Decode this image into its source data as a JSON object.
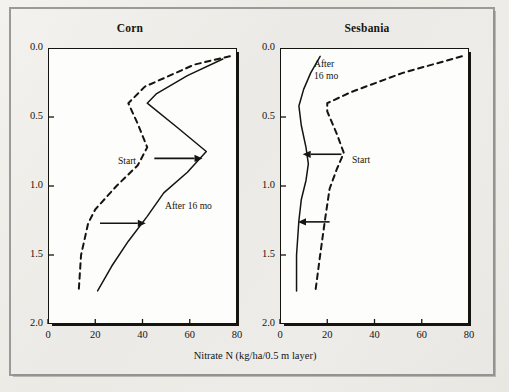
{
  "figure": {
    "background_color": "#efeeea",
    "frame_color": "#9a9a98",
    "ink_color": "#15140f",
    "plot_background": "#fdfdfb"
  },
  "axis": {
    "x_label": "Nitrate N (kg/ha/0.5 m layer)",
    "x_ticks": [
      "0",
      "20",
      "40",
      "60",
      "80"
    ],
    "y_ticks": [
      "0.0",
      "0.5",
      "1.0",
      "1.5",
      "2.0"
    ]
  },
  "panels": [
    {
      "title": "Corn",
      "annotations": [
        {
          "name": "start-label",
          "text": "Start"
        },
        {
          "name": "after-label",
          "text": "After 16 mo"
        }
      ],
      "arrow_direction": "right"
    },
    {
      "title": "Sesbania",
      "annotations": [
        {
          "name": "after-label",
          "text": "After"
        },
        {
          "name": "after-label-2",
          "text": "16 mo"
        },
        {
          "name": "start-label",
          "text": "Start"
        }
      ],
      "arrow_direction": "left"
    }
  ],
  "chart_data": {
    "type": "line",
    "xlabel": "Nitrate N (kg/ha/0.5 m layer)",
    "ylabel": "Soil depth (m)",
    "xlim": [
      0,
      80
    ],
    "ylim": [
      2.0,
      0.0
    ],
    "y_inverted": true,
    "xticks": [
      0,
      20,
      40,
      60,
      80
    ],
    "yticks": [
      0.0,
      0.5,
      1.0,
      1.5,
      2.0
    ],
    "grid": false,
    "legend": "in-plot annotations",
    "panels": [
      {
        "name": "Corn",
        "series": [
          {
            "name": "Start",
            "style": "dashed",
            "x": [
              77,
              62,
              41,
              34,
              38,
              42,
              38,
              29,
              20,
              17,
              14,
              13
            ],
            "y": [
              0.06,
              0.12,
              0.28,
              0.4,
              0.55,
              0.72,
              0.85,
              1.0,
              1.17,
              1.27,
              1.5,
              1.76
            ]
          },
          {
            "name": "After 16 mo",
            "style": "solid",
            "x": [
              74,
              59,
              46,
              42,
              55,
              67,
              59,
              49,
              42,
              34,
              27,
              21
            ],
            "y": [
              0.08,
              0.2,
              0.33,
              0.4,
              0.58,
              0.75,
              0.9,
              1.05,
              1.22,
              1.4,
              1.58,
              1.76
            ]
          }
        ],
        "arrows": [
          {
            "from_x": 45,
            "to_x": 62,
            "y": 0.8,
            "direction": "right"
          },
          {
            "from_x": 22,
            "to_x": 38,
            "y": 1.27,
            "direction": "right"
          }
        ]
      },
      {
        "name": "Sesbania",
        "series": [
          {
            "name": "Start",
            "style": "dashed",
            "x": [
              77,
              52,
              30,
              20,
              20,
              24,
              27,
              24,
              21,
              19,
              17,
              15
            ],
            "y": [
              0.06,
              0.18,
              0.32,
              0.4,
              0.46,
              0.62,
              0.76,
              0.88,
              1.02,
              1.25,
              1.5,
              1.76
            ]
          },
          {
            "name": "After 16 mo",
            "style": "solid",
            "x": [
              17,
              13,
              10,
              8,
              9,
              11,
              12,
              11,
              9,
              8,
              7,
              7
            ],
            "y": [
              0.06,
              0.18,
              0.3,
              0.42,
              0.56,
              0.72,
              0.84,
              0.96,
              1.1,
              1.25,
              1.5,
              1.76
            ]
          }
        ],
        "arrows": [
          {
            "from_x": 26,
            "to_x": 13,
            "y": 0.77,
            "direction": "left"
          },
          {
            "from_x": 21,
            "to_x": 11,
            "y": 1.26,
            "direction": "left"
          }
        ]
      }
    ]
  }
}
